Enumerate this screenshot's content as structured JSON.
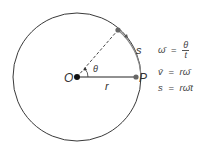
{
  "diagram": {
    "labels": {
      "origin": "O",
      "point": "P",
      "radius": "r",
      "arc": "s",
      "angle": "θ"
    },
    "equations": [
      {
        "lhs": "ω̄",
        "eq": "=",
        "num": "θ",
        "den": "t"
      },
      {
        "lhs": "v̄",
        "eq": "=",
        "rhs": "rω̄"
      },
      {
        "lhs": "s",
        "eq": "=",
        "rhs": "rω̄t"
      }
    ],
    "colors": {
      "stroke": "#222222",
      "arc_highlight": "#777777",
      "point": "#666666"
    }
  }
}
